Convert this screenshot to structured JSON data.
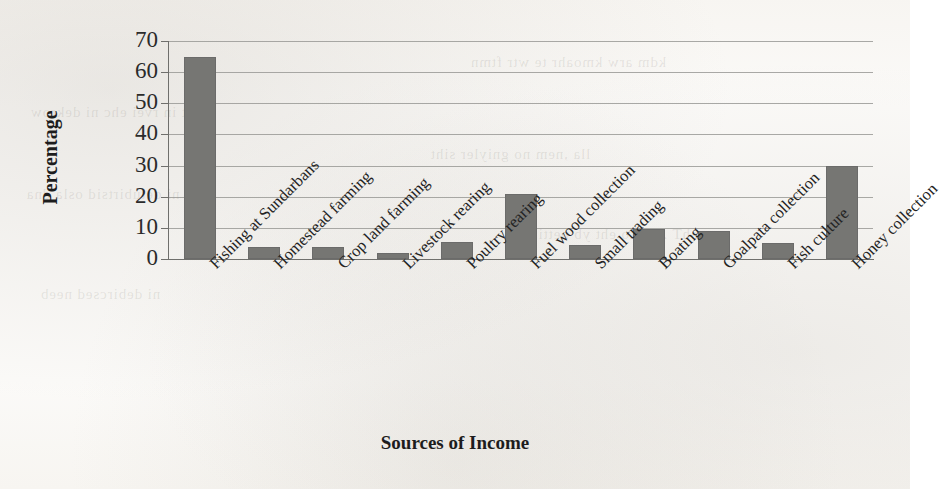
{
  "chart_data": {
    "type": "bar",
    "title": "",
    "xlabel": "Sources of Income",
    "ylabel": "Percentage",
    "ylim": [
      0,
      70
    ],
    "ytick_step": 10,
    "yticks": [
      70,
      60,
      50,
      40,
      30,
      20,
      10,
      0
    ],
    "grid": true,
    "legend": false,
    "legend_position": "none",
    "bar_color": "#767673",
    "gridline_color": "#9a9a96",
    "axis_color": "#6f6f6c",
    "categories": [
      "Fishing at Sundarbans",
      "Homestead farming",
      "Crop land farming",
      "Livestock rearing",
      "Poultry rearing",
      "Fuel wood collection",
      "Small trading",
      "Boating",
      "Goalpata collection",
      "Fish culture",
      "Honey collection"
    ],
    "values": [
      65,
      4,
      4,
      2,
      5.5,
      21,
      4.5,
      9.5,
      9,
      5,
      30
    ]
  },
  "page": {
    "background_bleed": [
      "kdm arw kmoahr te wtr ftmn",
      "eht in rvei ehc ni dekrow",
      "lla ,nem no gniyler siht",
      "ni detubirtsid osla dna",
      "ehT .srehto eht yb nettirw",
      "ni debircsed neeb"
    ]
  }
}
